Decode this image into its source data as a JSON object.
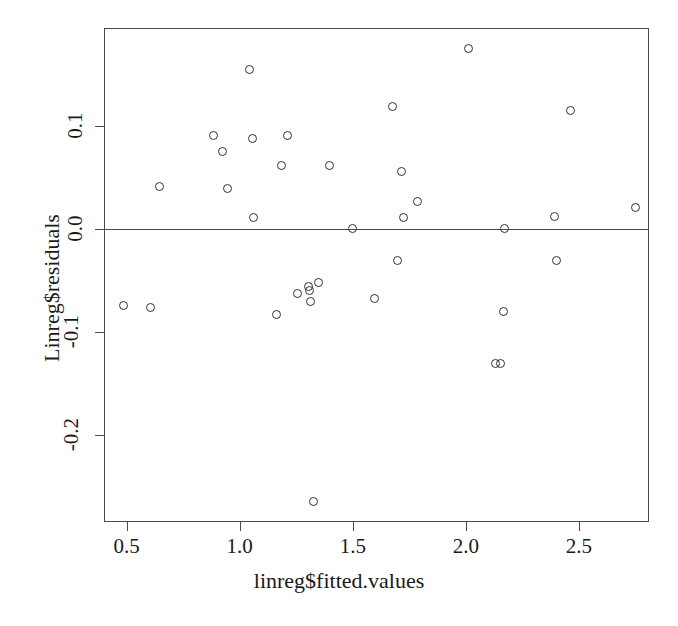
{
  "chart_data": {
    "type": "scatter",
    "title": "",
    "xlabel": "linreg$fitted.values",
    "ylabel": "Linreg$residuals",
    "xlim": [
      0.4,
      2.81
    ],
    "ylim": [
      -0.285,
      0.195
    ],
    "grid": false,
    "legend": null,
    "x_ticks": [
      0.5,
      1.0,
      1.5,
      2.0,
      2.5
    ],
    "x_tick_labels": [
      "0.5",
      "1.0",
      "1.5",
      "2.0",
      "2.5"
    ],
    "y_ticks": [
      0.1,
      0.0,
      -0.1,
      -0.2
    ],
    "y_tick_labels": [
      "0.1",
      "0.0",
      "-0.1",
      "-0.2"
    ],
    "reference_lines": [
      {
        "axis": "y",
        "value": 0.0
      }
    ],
    "marker": "open-circle",
    "marker_color": "#333333",
    "points": [
      {
        "x": 0.485,
        "y": -0.075
      },
      {
        "x": 0.605,
        "y": -0.077
      },
      {
        "x": 0.645,
        "y": 0.041
      },
      {
        "x": 0.885,
        "y": 0.091
      },
      {
        "x": 0.925,
        "y": 0.075
      },
      {
        "x": 0.945,
        "y": 0.039
      },
      {
        "x": 1.045,
        "y": 0.155
      },
      {
        "x": 1.055,
        "y": 0.088
      },
      {
        "x": 1.06,
        "y": 0.011
      },
      {
        "x": 1.165,
        "y": -0.083
      },
      {
        "x": 1.185,
        "y": 0.061
      },
      {
        "x": 1.21,
        "y": 0.091
      },
      {
        "x": 1.255,
        "y": -0.063
      },
      {
        "x": 1.305,
        "y": -0.056
      },
      {
        "x": 1.31,
        "y": -0.06
      },
      {
        "x": 1.315,
        "y": -0.071
      },
      {
        "x": 1.325,
        "y": -0.265
      },
      {
        "x": 1.35,
        "y": -0.052
      },
      {
        "x": 1.395,
        "y": 0.061
      },
      {
        "x": 1.5,
        "y": 0.0
      },
      {
        "x": 1.595,
        "y": -0.068
      },
      {
        "x": 1.675,
        "y": 0.119
      },
      {
        "x": 1.7,
        "y": -0.031
      },
      {
        "x": 1.715,
        "y": 0.056
      },
      {
        "x": 1.725,
        "y": 0.011
      },
      {
        "x": 1.785,
        "y": 0.026
      },
      {
        "x": 2.01,
        "y": 0.175
      },
      {
        "x": 2.13,
        "y": -0.131
      },
      {
        "x": 2.155,
        "y": -0.131
      },
      {
        "x": 2.165,
        "y": -0.08
      },
      {
        "x": 2.17,
        "y": 0.0
      },
      {
        "x": 2.39,
        "y": 0.012
      },
      {
        "x": 2.4,
        "y": -0.031
      },
      {
        "x": 2.465,
        "y": 0.115
      },
      {
        "x": 2.75,
        "y": 0.021
      }
    ]
  },
  "axis": {
    "x_label": "linreg$fitted.values",
    "y_label": "Linreg$residuals"
  }
}
